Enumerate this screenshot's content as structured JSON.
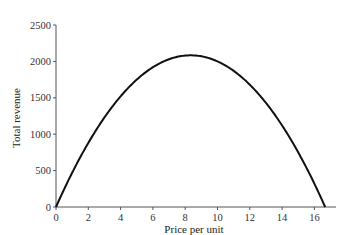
{
  "chart_data": {
    "type": "line",
    "title": "",
    "xlabel": "Price per unit",
    "ylabel": "Total revenue",
    "xlim": [
      0,
      17
    ],
    "ylim": [
      0,
      2500
    ],
    "x_ticks": [
      0,
      2,
      4,
      6,
      8,
      10,
      12,
      14,
      16
    ],
    "y_ticks": [
      0,
      500,
      1000,
      1500,
      2000,
      2500
    ],
    "grid": false,
    "legend": null,
    "series": [
      {
        "name": "Total revenue",
        "color": "#111111",
        "x": [
          0,
          1,
          2,
          3,
          4,
          5,
          6,
          7,
          8,
          8.33,
          9,
          10,
          11,
          12,
          13,
          14,
          15,
          16,
          16.67
        ],
        "values": [
          0,
          470,
          880,
          1230,
          1520,
          1750,
          1920,
          2030,
          2080,
          2083,
          2070,
          2000,
          1870,
          1680,
          1430,
          1120,
          750,
          320,
          0
        ]
      }
    ],
    "annotations": []
  }
}
